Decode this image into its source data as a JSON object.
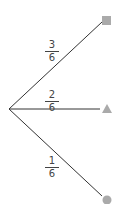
{
  "diagram": {
    "type": "probability-tree",
    "root": {
      "x": 9,
      "y": 109
    },
    "branches": [
      {
        "probability": {
          "numerator": "3",
          "denominator": "6"
        },
        "outcome": "square",
        "end": {
          "x": 104,
          "y": 21
        },
        "label_pos": {
          "x": 45,
          "y": 40
        }
      },
      {
        "probability": {
          "numerator": "2",
          "denominator": "6"
        },
        "outcome": "triangle",
        "end": {
          "x": 100,
          "y": 109
        },
        "label_pos": {
          "x": 45,
          "y": 90
        }
      },
      {
        "probability": {
          "numerator": "1",
          "denominator": "6"
        },
        "outcome": "circle",
        "end": {
          "x": 103,
          "y": 196
        },
        "label_pos": {
          "x": 45,
          "y": 158
        }
      }
    ],
    "colors": {
      "line": "#333333",
      "shape": "#aaaaaa",
      "text": "#444444"
    }
  }
}
